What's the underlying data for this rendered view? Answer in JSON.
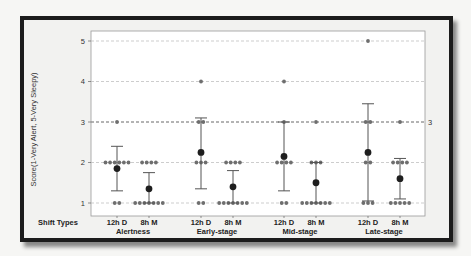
{
  "chart_data": {
    "type": "scatter",
    "subtype": "individual value plot with mean and 95% CI error bars",
    "title": "",
    "ylabel": "Score(1-Very Alert, 5-Very Sleepy)",
    "xlabel_row_title": "Shift Types",
    "ylim": [
      0.8,
      5.25
    ],
    "yticks": [
      1,
      2,
      3,
      4,
      5
    ],
    "grid": "horizontal dashed",
    "reference_line": {
      "y": 3,
      "label": "3"
    },
    "groups": [
      "Alertness",
      "Early-stage",
      "Mid-stage",
      "Late-stage"
    ],
    "shift_types": [
      "12h D",
      "8h M"
    ],
    "series": [
      {
        "group": "Alertness",
        "shift": "12h D",
        "mean": 1.85,
        "ci_low": 1.3,
        "ci_high": 2.4,
        "points": {
          "1": 2,
          "2": 6,
          "3": 1
        }
      },
      {
        "group": "Alertness",
        "shift": "8h M",
        "mean": 1.35,
        "ci_low": 1.0,
        "ci_high": 1.75,
        "points": {
          "1": 7,
          "2": 4
        }
      },
      {
        "group": "Early-stage",
        "shift": "12h D",
        "mean": 2.25,
        "ci_low": 1.35,
        "ci_high": 3.1,
        "points": {
          "1": 2,
          "2": 3,
          "3": 2,
          "4": 1
        }
      },
      {
        "group": "Early-stage",
        "shift": "8h M",
        "mean": 1.4,
        "ci_low": 1.0,
        "ci_high": 1.8,
        "points": {
          "1": 7,
          "2": 4
        }
      },
      {
        "group": "Mid-stage",
        "shift": "12h D",
        "mean": 2.15,
        "ci_low": 1.3,
        "ci_high": 3.0,
        "points": {
          "1": 2,
          "2": 4,
          "3": 1,
          "4": 1
        }
      },
      {
        "group": "Mid-stage",
        "shift": "8h M",
        "mean": 1.5,
        "ci_low": 1.0,
        "ci_high": 2.0,
        "points": {
          "1": 7,
          "2": 3,
          "3": 1
        }
      },
      {
        "group": "Late-stage",
        "shift": "12h D",
        "mean": 2.25,
        "ci_low": 1.05,
        "ci_high": 3.45,
        "points": {
          "1": 3,
          "2": 2,
          "3": 2,
          "5": 1
        }
      },
      {
        "group": "Late-stage",
        "shift": "8h M",
        "mean": 1.6,
        "ci_low": 1.1,
        "ci_high": 2.1,
        "points": {
          "1": 5,
          "2": 4,
          "3": 1
        }
      }
    ]
  },
  "labels": {
    "ylabel": "Score(1-Very Alert, 5-Very Sleepy)",
    "row_title": "Shift Types",
    "ref_label": "3"
  }
}
